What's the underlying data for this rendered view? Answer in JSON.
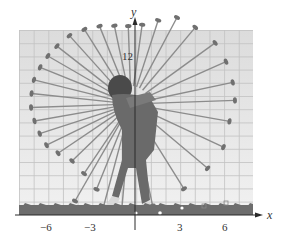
{
  "figure": {
    "axes": {
      "x_label": "x",
      "y_label": "y",
      "x_tick_labels": [
        "−6",
        "−3",
        "3",
        "6"
      ],
      "y_tick_labels": [
        "12"
      ]
    },
    "colors": {
      "grid_bg": "#e6e6e6",
      "grid_line": "#c4c4c4",
      "axis": "#2a2a2a",
      "club": "#8a8a8a",
      "club_head": "#6e6e6e",
      "golfer": "#5a5a5a",
      "grass": "#6b6b6b"
    }
  },
  "chart_data": {
    "type": "diagram",
    "title": "",
    "xlabel": "x",
    "ylabel": "y",
    "x_ticks": [
      -6,
      -3,
      3,
      6
    ],
    "y_ticks": [
      12
    ],
    "xlim": [
      -8,
      8
    ],
    "ylim": [
      0,
      14
    ],
    "grid": true,
    "pivot_approx": [
      -0.3,
      8.7
    ],
    "club_count_approx": 30
  }
}
